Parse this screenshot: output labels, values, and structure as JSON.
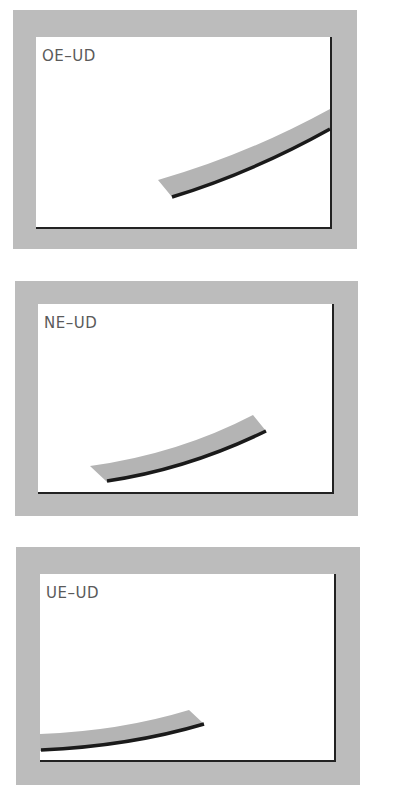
{
  "colors": {
    "panel_border": "#bcbcbc",
    "frame_bg": "#ffffff",
    "frame_edge": "#222222",
    "band_fill": "#b4b4b4",
    "band_edge": "#1a1a1a",
    "label": "#5a5a5a"
  },
  "panels": [
    {
      "label": "OE–UD"
    },
    {
      "label": "NE–UD"
    },
    {
      "label": "UE–UD"
    }
  ]
}
